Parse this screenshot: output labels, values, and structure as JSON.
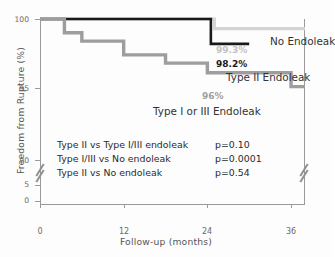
{
  "chart_data": {
    "type": "line",
    "subtype": "kaplan-meier-step",
    "title": "",
    "xlabel": "Follow-up (months)",
    "ylabel": "Freedom from Rupture (%)",
    "xlim": [
      0,
      38
    ],
    "ylim": [
      0,
      100
    ],
    "y_axis_break": true,
    "y_break_between": [
      5,
      90
    ],
    "grid": false,
    "legend_position": "inline-right",
    "xticks": [
      "0",
      "12",
      "24",
      "36"
    ],
    "xtick_values": [
      0,
      12,
      24,
      36
    ],
    "yticks": [
      "100",
      "95",
      "90",
      "5",
      "0"
    ],
    "ytick_values": [
      100,
      95,
      90,
      5,
      0
    ],
    "series": [
      {
        "name": "No Endoleak",
        "color": "#d4d4d4",
        "endpoint_label": "99.3%",
        "endpoint_value": 99.3,
        "x": [
          0,
          25,
          25,
          38
        ],
        "y": [
          100,
          100,
          99.3,
          99.3
        ]
      },
      {
        "name": "Type II Endoleak",
        "color": "#1a1a1a",
        "endpoint_label": "98.2%",
        "endpoint_value": 98.2,
        "x": [
          0,
          24.5,
          24.5,
          30
        ],
        "y": [
          100,
          100,
          98.2,
          98.2
        ]
      },
      {
        "name": "Type I or III Endoleak",
        "color": "#9d9d9d",
        "endpoint_label": "96%",
        "endpoint_value": 96.0,
        "x": [
          0,
          3.5,
          3.5,
          6,
          6,
          12,
          12,
          18,
          18,
          24,
          24,
          36,
          36,
          38
        ],
        "y": [
          100,
          100,
          99,
          99,
          98.4,
          98.4,
          97.4,
          97.4,
          96.8,
          96.8,
          96.1,
          96.1,
          95.1,
          95.1
        ]
      }
    ],
    "annotations": [
      {
        "comparison": "Type II vs Type I/III endoleak",
        "p": "p=0.10"
      },
      {
        "comparison": "Type I/III vs No endoleak",
        "p": "p=0.0001"
      },
      {
        "comparison": "Type II vs No endoleak",
        "p": "p=0.54"
      }
    ]
  }
}
